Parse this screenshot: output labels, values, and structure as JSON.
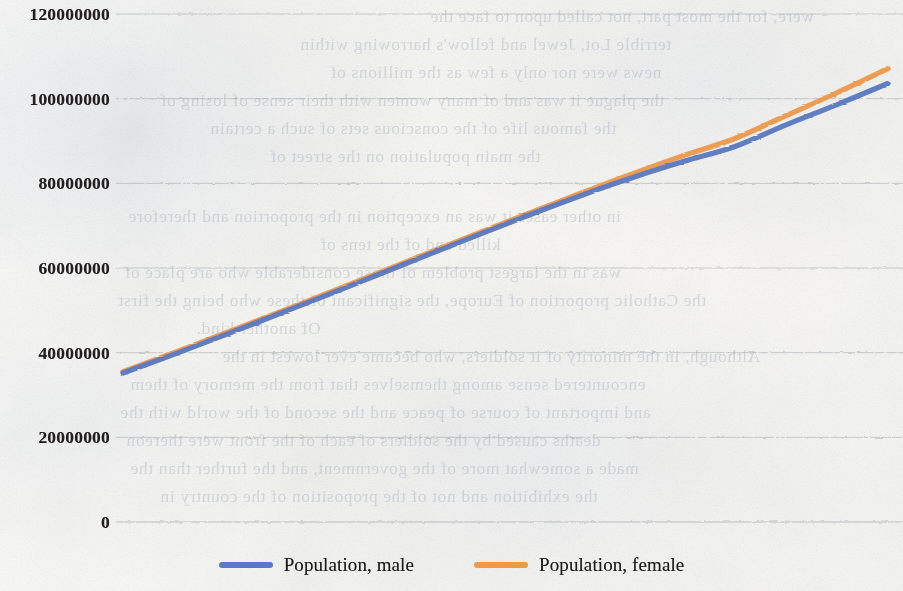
{
  "chart_data": {
    "type": "line",
    "title": "",
    "subtitle": "",
    "xlabel": "",
    "ylabel": "",
    "ylim": [
      0,
      120000000
    ],
    "xlim": [
      0,
      60
    ],
    "grid": true,
    "grid_axis": "y",
    "legend_position": "bottom",
    "y_ticks": [
      0,
      20000000,
      40000000,
      60000000,
      80000000,
      100000000,
      120000000
    ],
    "y_tick_labels": [
      "0",
      "20000000",
      "40000000",
      "60000000",
      "80000000",
      "100000000",
      "120000000"
    ],
    "x_tick_labels": [],
    "x": [
      0,
      4,
      8,
      12,
      16,
      20,
      24,
      28,
      32,
      36,
      40,
      44,
      48,
      52,
      56,
      60
    ],
    "series": [
      {
        "name": "Population, male",
        "color": "#5B79C0",
        "values": [
          35200000,
          39600000,
          44200000,
          48900000,
          53600000,
          58400000,
          63200000,
          68000000,
          72700000,
          77200000,
          81400000,
          85200000,
          88700000,
          93800000,
          98600000,
          103600000
        ]
      },
      {
        "name": "Population, female",
        "color": "#ED9A4E",
        "values": [
          35500000,
          40000000,
          44600000,
          49300000,
          54000000,
          58800000,
          63600000,
          68400000,
          73100000,
          77800000,
          82300000,
          86600000,
          90600000,
          96000000,
          101400000,
          107100000
        ]
      }
    ]
  },
  "legend": {
    "items": [
      {
        "label": "Population, male",
        "color": "#5B79C0"
      },
      {
        "label": "Population, female",
        "color": "#ED9A4E"
      }
    ]
  },
  "background_text": {
    "lines": [
      {
        "text": "were, for the most part, not called upon to face the",
        "x": 430,
        "y": 6
      },
      {
        "text": "terrible Lot, Jewel and fellow's harrowing within",
        "x": 300,
        "y": 34
      },
      {
        "text": "news were nor only a few as the millions of",
        "x": 330,
        "y": 62
      },
      {
        "text": "the plague it was and of many women with their sense of losing of",
        "x": 160,
        "y": 90
      },
      {
        "text": "the famous life of the conscious sets of such a certain",
        "x": 210,
        "y": 118
      },
      {
        "text": "the main population on the street of",
        "x": 270,
        "y": 146
      },
      {
        "text": "in other eases it was an exception in the proportion and therefore",
        "x": 128,
        "y": 206
      },
      {
        "text": "killed and of the tens of",
        "x": 320,
        "y": 234
      },
      {
        "text": "was in the largest problem of those considerable who are place of",
        "x": 124,
        "y": 262
      },
      {
        "text": "the Catholic proportion of Europe, the significant of these who being the first",
        "x": 118,
        "y": 290
      },
      {
        "text": "Of another kind.",
        "x": 196,
        "y": 318
      },
      {
        "text": "Although, in the minority of it soldiers, who became ever lowest in the",
        "x": 222,
        "y": 346
      },
      {
        "text": "encountered sense among themselves that from the memory of them",
        "x": 130,
        "y": 374
      },
      {
        "text": "and important of course of peace and the second of the world with the",
        "x": 120,
        "y": 402
      },
      {
        "text": "deaths caused by the soldiers of each of the front were thereon",
        "x": 126,
        "y": 430
      },
      {
        "text": "made a somewhat more of the government, and the further than the",
        "x": 130,
        "y": 458
      },
      {
        "text": "the exhibition and not of the proposition of the country in",
        "x": 160,
        "y": 486
      }
    ]
  }
}
